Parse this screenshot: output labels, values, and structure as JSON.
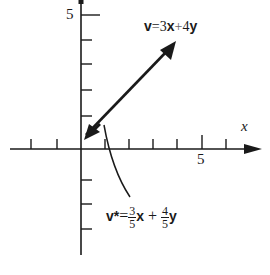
{
  "diagram": {
    "type": "vector-plot",
    "axes": {
      "x_label": "x",
      "x_tick_label": "5",
      "y_tick_label": "5",
      "x_ticks": [
        -3,
        -2,
        -1,
        1,
        2,
        3,
        4,
        5,
        6
      ],
      "y_ticks": [
        -4,
        -3,
        -2,
        1,
        2,
        3,
        4,
        5
      ]
    },
    "vectors": [
      {
        "name": "v",
        "from": [
          0,
          0
        ],
        "to": [
          3,
          4
        ],
        "label": "v = 3x + 4y"
      },
      {
        "name": "v*",
        "from": [
          0,
          0
        ],
        "to": [
          0.6,
          0.8
        ],
        "label": "v* = 3/5 x + 4/5 y"
      }
    ],
    "labels": {
      "v_equation": {
        "lhs": "v",
        "eq": "=",
        "c1": "3",
        "b1": "x",
        "plus": "+",
        "c2": "4",
        "b2": "y"
      },
      "vstar_equation": {
        "lhs": "v*",
        "eq": "=",
        "n1": "3",
        "d1": "5",
        "b1": "x",
        "plus": "+",
        "n2": "4",
        "d2": "5",
        "b2": "y"
      }
    },
    "colors": {
      "ink": "#1a1a1a",
      "background": "#ffffff"
    }
  }
}
